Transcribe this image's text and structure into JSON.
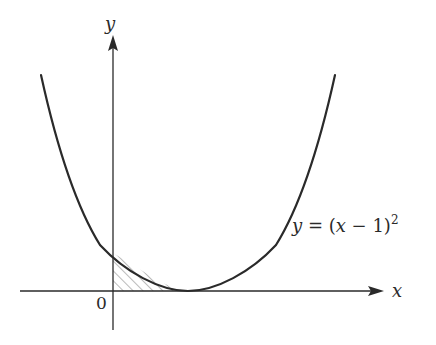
{
  "diagram": {
    "type": "function-graph",
    "axes": {
      "x_label": "x",
      "y_label": "y",
      "origin_label": "0"
    },
    "curve": {
      "equation_prefix": "y = (",
      "equation_var": "x",
      "equation_mid": " − 1)",
      "equation_exp": "2",
      "vertex": [
        1,
        0
      ],
      "y_intercept": 1
    },
    "shaded_region": {
      "description": "area under curve between x=0 and x=1",
      "pattern": "diagonal hatching"
    },
    "colors": {
      "stroke": "#2a2a2a",
      "hatch": "#777777",
      "background": "#ffffff"
    }
  }
}
